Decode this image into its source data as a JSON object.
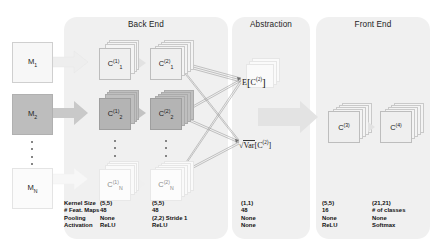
{
  "figure": {
    "panels": [
      {
        "title": "Back End"
      },
      {
        "title": "Abstraction"
      },
      {
        "title": "Front End"
      }
    ],
    "inputs": [
      {
        "label": "M",
        "index": "1"
      },
      {
        "label": "M",
        "index": "2"
      },
      {
        "label": "M",
        "index": "N"
      }
    ],
    "backend_blocks": [
      {
        "label": "C",
        "sub": "1",
        "sup": "(1)"
      },
      {
        "label": "C",
        "sub": "1",
        "sup": "(2)"
      },
      {
        "label": "C",
        "sub": "2",
        "sup": "(1)"
      },
      {
        "label": "C",
        "sub": "2",
        "sup": "(2)"
      },
      {
        "label": "C",
        "sub": "N",
        "sup": "(1)"
      },
      {
        "label": "C",
        "sub": "N",
        "sup": "(2)"
      }
    ],
    "abstraction_ops": [
      {
        "op": "E",
        "bracket_open": "[",
        "arg": "C",
        "arg_sup": "(2)",
        "bracket_close": "]"
      },
      {
        "op": "Var",
        "radical": "√",
        "bracket_open": "[",
        "arg": "C",
        "arg_sup": "(2)",
        "bracket_close": "]"
      }
    ],
    "frontend_blocks": [
      {
        "label": "C",
        "sup": "(3)"
      },
      {
        "label": "C",
        "sup": "(4)"
      }
    ],
    "ellipsis": "⋮"
  },
  "spec_table": {
    "row_labels": [
      "Kernel Size",
      "# Feat. Maps",
      "Pooling",
      "Activation"
    ],
    "columns": [
      {
        "name": "C(1)",
        "values": [
          "(5,5)",
          "48",
          "None",
          "ReLU"
        ]
      },
      {
        "name": "C(2)",
        "values": [
          "(5,5)",
          "48",
          "(2,2) Stride 1",
          "ReLU"
        ]
      },
      {
        "name": "abstraction",
        "values": [
          "(1,1)",
          "48",
          "None",
          "None"
        ]
      },
      {
        "name": "C(3)",
        "values": [
          "(5,5)",
          "16",
          "None",
          "ReLU"
        ]
      },
      {
        "name": "C(4)",
        "values": [
          "(21,21)",
          "# of classes",
          "None",
          "Softmax"
        ]
      }
    ]
  },
  "colors": {
    "panel_bg": "#f0f0f0",
    "cube_light": "#f4f4f4",
    "cube_dark": "#bfbfbf",
    "page_bg": "#ffffff",
    "text": "#1a1a1a"
  }
}
